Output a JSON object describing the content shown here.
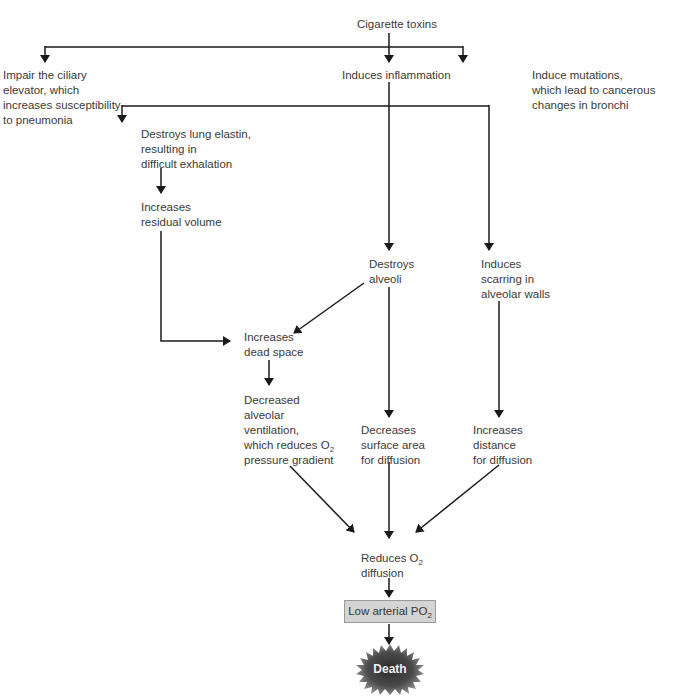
{
  "diagram": {
    "root": "Cigarette toxins",
    "level1": {
      "left": "Impair the ciliary\nelevator, which\nincreases susceptibility\nto pneumonia",
      "center": "Induces inflammation",
      "right": "Induce mutations,\nwhich lead to cancerous\nchanges in bronchi"
    },
    "elastin": "Destroys lung elastin,\nresulting in\ndifficult exhalation",
    "residual": "Increases\nresidual volume",
    "alveoli": "Destroys\nalveoli",
    "scarring": "Induces\nscarring in\nalveolar walls",
    "dead_space": "Increases\ndead space",
    "ventilation": {
      "line1": "Decreased\nalveolar\nventilation,\nwhich reduces O",
      "sub": "2",
      "line2": "pressure gradient"
    },
    "surface": "Decreases\nsurface area\nfor diffusion",
    "distance": "Increases\ndistance\nfor diffusion",
    "reduces": {
      "prefix": "Reduces O",
      "sub": "2",
      "suffix": "diffusion"
    },
    "low_po2": {
      "prefix": "Low arterial PO",
      "sub": "2"
    },
    "death": "Death",
    "colors": {
      "line": "#1a1a1a",
      "box_fill": "#d4d4d4",
      "death_dark": "#2a2a2a",
      "death_mid": "#8a8a8a"
    }
  }
}
